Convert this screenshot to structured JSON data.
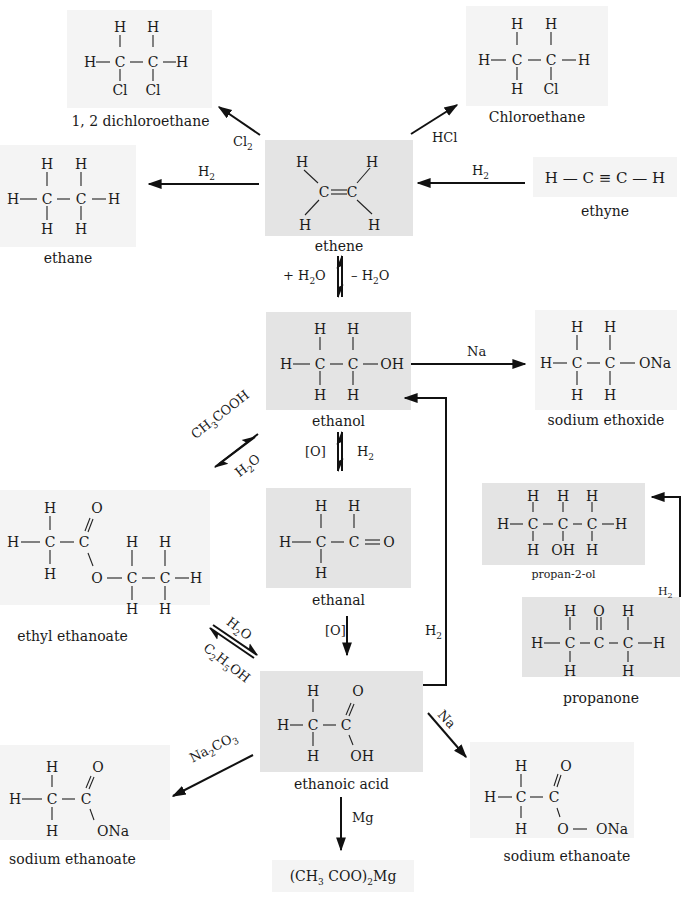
{
  "compounds": {
    "dichloroethane": {
      "name": "1, 2 dichloroethane",
      "formula": "CH2Cl-CH2Cl"
    },
    "chloroethane": {
      "name": "Chloroethane",
      "formula": "CH3-CH2Cl"
    },
    "ethane": {
      "name": "ethane",
      "formula": "CH3-CH3"
    },
    "ethene": {
      "name": "ethene",
      "formula": "CH2=CH2"
    },
    "ethyne": {
      "name": "ethyne",
      "formula": "H — C ≡ C — H"
    },
    "ethanol": {
      "name": "ethanol",
      "formula": "CH3-CH2-OH"
    },
    "sodium_ethoxide": {
      "name": "sodium ethoxide",
      "formula": "CH3-CH2-ONa"
    },
    "ethanal": {
      "name": "ethanal",
      "formula": "CH3-CHO"
    },
    "ethyl_ethanoate": {
      "name": "ethyl ethanoate",
      "formula": "CH3-COO-CH2-CH3"
    },
    "propan2ol": {
      "name": "propan-2-ol",
      "formula": "CH3-CH(OH)-CH3"
    },
    "propanone": {
      "name": "propanone",
      "formula": "CH3-CO-CH3"
    },
    "ethanoic_acid": {
      "name": "ethanoic acid",
      "formula": "CH3-COOH"
    },
    "sodium_ethanoate_left": {
      "name": "sodium ethanoate",
      "formula": "CH3-COONa"
    },
    "sodium_ethanoate_right": {
      "name": "sodium ethanoate",
      "formula": "CH3-CO-O-ONa"
    },
    "magnesium_ethanoate": {
      "name": "(CH3 COO)2Mg"
    }
  },
  "reagents": {
    "cl2": "Cl2",
    "hcl": "HCl",
    "h2_ethane": "H2",
    "h2_ethyne": "H2",
    "plus_h2o": "+ H2O",
    "minus_h2o": "– H2O",
    "na_ethoxide": "Na",
    "ch3cooh": "CH3COOH",
    "h2o_ester": "H2O",
    "ox_ethanol": "[O]",
    "h2_ethanal": "H2",
    "ox_ethanal": "[O]",
    "h2_acid": "H2",
    "h2o_hydrolysis": "H2O",
    "c2h5oh": "C2H5OH",
    "h2_propanone": "H2",
    "na2co3": "Na2CO3",
    "na_acid": "Na",
    "mg": "Mg"
  },
  "atoms": {
    "H": "H",
    "C": "C",
    "O": "O",
    "Cl": "Cl",
    "OH": "OH",
    "ONa": "ONa",
    "Na": "Na"
  }
}
